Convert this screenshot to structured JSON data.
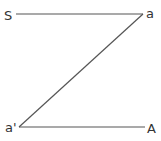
{
  "diagram": {
    "labels": {
      "top_left": "S",
      "top_right": "a",
      "bottom_left": "a'",
      "bottom_right": "A"
    },
    "segments": [
      {
        "from": "S",
        "to": "a"
      },
      {
        "from": "a",
        "to": "a'"
      },
      {
        "from": "a'",
        "to": "A"
      }
    ],
    "colors": {
      "line": "#555555",
      "text": "#333333",
      "background": "#ffffff"
    }
  }
}
